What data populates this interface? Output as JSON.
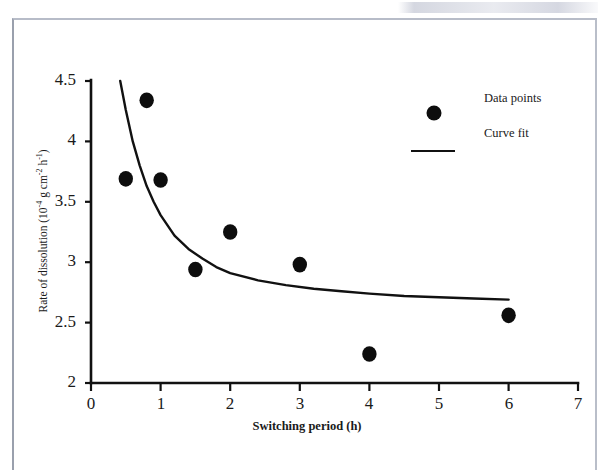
{
  "figure": {
    "kind": "scientific-line-scatter-figure",
    "background_color": "#ffffff",
    "frame_color": "#9aa0ad",
    "ink_color": "#111111"
  },
  "axis_titles": {
    "x": "Switching period (h)",
    "y_prefix": "Rate of dissolution (10",
    "y_sup1": "-4",
    "y_mid": " g cm",
    "y_sup2": "-2",
    "y_mid2": " h",
    "y_sup3": "-1",
    "y_suffix": ")",
    "y_plain": "Rate of dissolution (10-4 g cm-2 h-1)"
  },
  "legend": {
    "position": "top-right-inside",
    "entries": [
      {
        "label": "Data points",
        "marker": "filled-circle",
        "color": "#0d0d0d"
      },
      {
        "label": "Curve fit",
        "marker": "line",
        "color": "#111111"
      }
    ]
  },
  "ticks": {
    "x": [
      "0",
      "1",
      "2",
      "3",
      "4",
      "5",
      "6",
      "7"
    ],
    "y": [
      "2",
      "2.5",
      "3",
      "3.5",
      "4",
      "4.5"
    ]
  },
  "chart_data": {
    "type": "scatter",
    "title": "",
    "subtitle": "",
    "xlabel": "Switching period (h)",
    "ylabel": "Rate of dissolution (10-4 g cm-2 h-1)",
    "xlim": [
      0,
      7
    ],
    "ylim": [
      2,
      4.5
    ],
    "xticks": [
      0,
      1,
      2,
      3,
      4,
      5,
      6,
      7
    ],
    "yticks": [
      2,
      2.5,
      3,
      3.5,
      4,
      4.5
    ],
    "grid": false,
    "legend_position": "upper right",
    "series": [
      {
        "name": "Data points",
        "type": "scatter",
        "marker": "filled-circle",
        "color": "#0d0d0d",
        "x": [
          0.5,
          0.8,
          1.0,
          1.5,
          2.0,
          3.0,
          4.0,
          6.0
        ],
        "y": [
          3.69,
          4.34,
          3.68,
          2.94,
          3.25,
          2.98,
          2.24,
          2.56
        ]
      },
      {
        "name": "Curve fit",
        "type": "line",
        "color": "#111111",
        "note": "monotonically decreasing power-law style fit from x=0.42 to x=6.0",
        "x": [
          0.42,
          0.5,
          0.6,
          0.7,
          0.8,
          0.9,
          1.0,
          1.2,
          1.4,
          1.6,
          1.8,
          2.0,
          2.4,
          2.8,
          3.2,
          3.6,
          4.0,
          4.5,
          5.0,
          5.5,
          6.0
        ],
        "y": [
          4.5,
          4.26,
          4.0,
          3.8,
          3.63,
          3.5,
          3.39,
          3.22,
          3.11,
          3.03,
          2.96,
          2.91,
          2.85,
          2.81,
          2.78,
          2.76,
          2.74,
          2.72,
          2.71,
          2.7,
          2.69
        ]
      }
    ]
  },
  "geometry": {
    "x0_px": 91,
    "x_per_unit_px": 69.6,
    "y_base_px": 383,
    "y_per_unit_px": 120.8
  }
}
